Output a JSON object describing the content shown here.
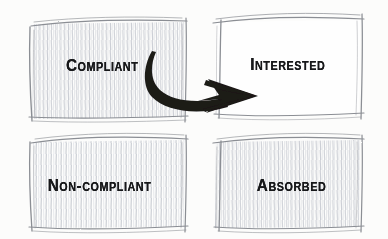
{
  "diagram": {
    "type": "2x2-matrix-sketch",
    "style": "hand-drawn pencil sketch on paper",
    "background_color": "#fcfcfb",
    "ink_color": "#17181a",
    "pencil_color": "#8d9096",
    "hatch_color": "#c9ccd2",
    "cells": [
      {
        "id": "compliant",
        "label": "Compliant",
        "position": "top-left",
        "fill": "hatched",
        "box": {
          "x": 30,
          "y": 20,
          "width": 155,
          "height": 98
        }
      },
      {
        "id": "interested",
        "label": "Interested",
        "position": "top-right",
        "fill": "blank",
        "box": {
          "x": 213,
          "y": 17,
          "width": 148,
          "height": 98
        }
      },
      {
        "id": "non-compliant",
        "label": "Non-compliant",
        "position": "bottom-left",
        "fill": "hatched",
        "box": {
          "x": 30,
          "y": 137,
          "width": 155,
          "height": 92
        }
      },
      {
        "id": "absorbed",
        "label": "Absorbed",
        "position": "bottom-right",
        "fill": "hatched",
        "box": {
          "x": 213,
          "y": 137,
          "width": 148,
          "height": 92
        }
      }
    ],
    "arrow": {
      "id": "compliant-to-interested",
      "from": "compliant",
      "to": "interested",
      "style": "thick curved brush arrow with barbed arrowhead",
      "color": "#1b1a18",
      "direction": "right"
    }
  }
}
